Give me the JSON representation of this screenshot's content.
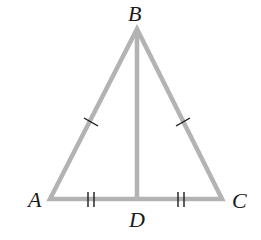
{
  "diagram": {
    "type": "isosceles-triangle-with-median",
    "points": {
      "A": {
        "label": "A",
        "x": 50,
        "y": 199
      },
      "B": {
        "label": "B",
        "x": 137,
        "y": 29
      },
      "C": {
        "label": "C",
        "x": 222,
        "y": 199
      },
      "D": {
        "label": "D",
        "x": 137,
        "y": 199
      }
    },
    "segments": [
      "AB",
      "BC",
      "CA",
      "BD"
    ],
    "congruence_marks": [
      {
        "segments": [
          "AB",
          "BC"
        ],
        "ticks": 1
      },
      {
        "segments": [
          "AD",
          "DC"
        ],
        "ticks": 2
      }
    ],
    "colors": {
      "line": "#b3b3b3",
      "mark": "#1a1a1a",
      "label": "#1a1a1a"
    }
  }
}
